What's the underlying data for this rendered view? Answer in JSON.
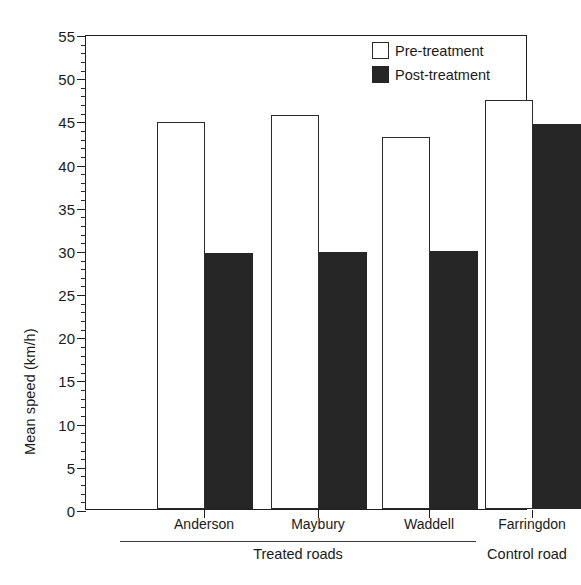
{
  "chart_data": {
    "type": "bar",
    "title": "",
    "xlabel": "",
    "ylabel": "Mean speed (km/h)",
    "categories": [
      "Anderson",
      "Maybury",
      "Waddell",
      "Farringdon"
    ],
    "series": [
      {
        "name": "Pre-treatment",
        "values": [
          44.8,
          45.6,
          43.1,
          47.4
        ],
        "color": "#ffffff",
        "edge_color": "#2b2b2b"
      },
      {
        "name": "Post-treatment",
        "values": [
          29.6,
          29.8,
          29.9,
          44.6
        ],
        "color": "#262626",
        "edge_color": "#262626"
      }
    ],
    "ylim": [
      0,
      55
    ],
    "ytick_step": 5,
    "yticks": [
      0,
      5,
      10,
      15,
      20,
      25,
      30,
      35,
      40,
      45,
      50,
      55
    ],
    "ytick_labels": [
      "0",
      "5",
      "10",
      "15",
      "20",
      "25",
      "30",
      "35",
      "40",
      "45",
      "50",
      "55"
    ],
    "minor_ticks_per_interval": 5,
    "grid": false,
    "legend_position": "top-right",
    "groups": [
      {
        "label": "Treated roads",
        "categories": [
          "Anderson",
          "Maybury",
          "Waddell"
        ],
        "underline": true
      },
      {
        "label": "Control road",
        "categories": [
          "Farringdon"
        ],
        "underline": false
      }
    ]
  },
  "axis": {
    "y_title": "Mean speed (km/h)"
  },
  "legend": {
    "entries": [
      {
        "label": "Pre-treatment",
        "swatch": "open-square"
      },
      {
        "label": "Post-treatment",
        "swatch": "filled-square"
      }
    ]
  },
  "xlabels": [
    "Anderson",
    "Maybury",
    "Waddell",
    "Farringdon"
  ],
  "group_labels": [
    "Treated roads",
    "Control road"
  ]
}
